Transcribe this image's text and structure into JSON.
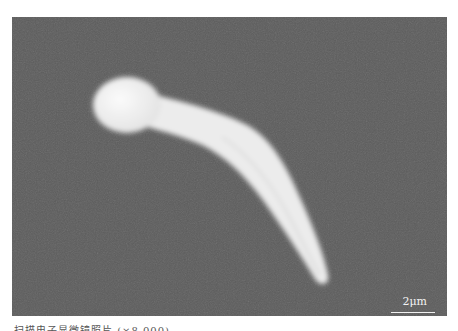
{
  "figure": {
    "background_color": "#5e5e5e",
    "specimen_color": "#f0f0f0",
    "scale_bar": {
      "label": "2μm"
    },
    "caption": {
      "text": "扫描电子显微镜照片 (×8,000)",
      "note": "caption partially cropped at bottom edge"
    }
  }
}
